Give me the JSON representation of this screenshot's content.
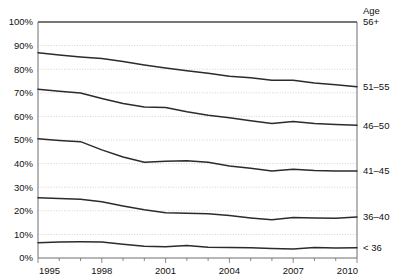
{
  "chart_data": {
    "type": "line",
    "title": "",
    "subtitle": "",
    "xlabel": "",
    "ylabel": "",
    "legend_title": "Age",
    "legend_position": "right",
    "grid": true,
    "grid_style": "dotted-horizontal",
    "xlim": [
      1995,
      2010
    ],
    "ylim": [
      0,
      100
    ],
    "y_tick_labels": [
      "0%",
      "10%",
      "20%",
      "30%",
      "40%",
      "50%",
      "60%",
      "70%",
      "80%",
      "90%",
      "100%"
    ],
    "y_tick_values": [
      0,
      10,
      20,
      30,
      40,
      50,
      60,
      70,
      80,
      90,
      100
    ],
    "x_tick_labels": [
      "1995",
      "1998",
      "2001",
      "2004",
      "2007",
      "2010"
    ],
    "x_tick_values": [
      1995,
      1998,
      2001,
      2004,
      2007,
      2010
    ],
    "x_minor_ticks": [
      1996,
      1997,
      1999,
      2000,
      2002,
      2003,
      2005,
      2006,
      2008,
      2009
    ],
    "x": [
      1995,
      1996,
      1997,
      1998,
      1999,
      2000,
      2001,
      2002,
      2003,
      2004,
      2005,
      2006,
      2007,
      2008,
      2009,
      2010
    ],
    "note": "Cumulative stacked share boundaries; each line is the upper edge of an age band. Top of plot = 100%.",
    "series": [
      {
        "name": "56+",
        "band_label": "56+",
        "label_value": 100,
        "values": [
          100,
          100,
          100,
          100,
          100,
          100,
          100,
          100,
          100,
          100,
          100,
          100,
          100,
          100,
          100,
          100
        ]
      },
      {
        "name": "51-55",
        "band_label": "51–55",
        "label_value": 87,
        "values": [
          87.0,
          86.0,
          85.2,
          84.5,
          83.3,
          81.8,
          80.5,
          79.3,
          78.3,
          77.0,
          76.4,
          75.3,
          75.3,
          74.2,
          73.4,
          72.6
        ]
      },
      {
        "name": "46-50",
        "band_label": "46–50",
        "label_value": 71.5,
        "values": [
          71.5,
          70.7,
          69.9,
          67.6,
          65.5,
          64.0,
          63.8,
          62.0,
          60.5,
          59.4,
          58.2,
          57.0,
          57.8,
          57.0,
          56.6,
          56.2
        ]
      },
      {
        "name": "41-45",
        "band_label": "41–45",
        "label_value": 50.5,
        "values": [
          50.5,
          49.8,
          49.3,
          45.8,
          42.8,
          40.6,
          41.0,
          41.2,
          40.6,
          39.0,
          38.0,
          36.9,
          37.6,
          37.1,
          36.9,
          36.9
        ]
      },
      {
        "name": "36-40",
        "band_label": "36–40",
        "label_value": 25.5,
        "values": [
          25.5,
          25.2,
          24.9,
          23.8,
          22.0,
          20.4,
          19.2,
          19.0,
          18.8,
          18.0,
          17.0,
          16.2,
          17.2,
          17.0,
          16.8,
          17.4
        ]
      },
      {
        "name": "<36",
        "band_label": "< 36",
        "label_value": 6.5,
        "values": [
          6.5,
          6.8,
          6.9,
          6.8,
          5.8,
          5.0,
          4.8,
          5.3,
          4.6,
          4.5,
          4.3,
          4.0,
          3.8,
          4.4,
          4.2,
          4.3
        ]
      }
    ],
    "right_labels": [
      {
        "text": "56+",
        "value": 100
      },
      {
        "text": "51–55",
        "value": 72.6
      },
      {
        "text": "46–50",
        "value": 56.2
      },
      {
        "text": "41–45",
        "value": 36.9
      },
      {
        "text": "36–40",
        "value": 17.4
      },
      {
        "text": "< 36",
        "value": 4.3
      }
    ],
    "colors": {
      "line": "#2b2b2b",
      "axis": "#6e6e6e",
      "grid": "#bfbfbf",
      "text": "#111111",
      "background": "#ffffff"
    }
  }
}
